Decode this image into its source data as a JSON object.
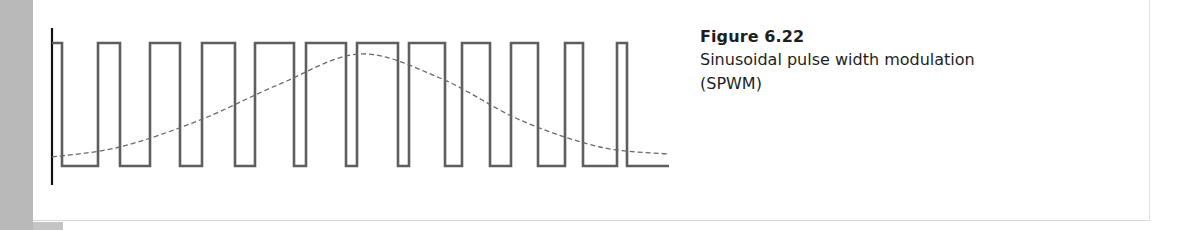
{
  "caption": {
    "label": "Figure 6.22",
    "text": "Sinusoidal pulse width modulation (SPWM)"
  },
  "colors": {
    "side_strip": "#b9b9b9",
    "pulse_stroke": "#5e5e5e",
    "axis_stroke": "#111111",
    "sine_stroke": "#6a6a6a"
  },
  "chart_data": {
    "type": "line",
    "title": "Sinusoidal pulse width modulation (SPWM)",
    "xlabel": "",
    "ylabel": "",
    "series": [
      {
        "name": "PWM pulse train",
        "style": "solid",
        "levels": {
          "high": 1,
          "low": 0
        },
        "pulses_high_x_px": [
          [
            52,
            62
          ],
          [
            98,
            120
          ],
          [
            150,
            180
          ],
          [
            202,
            235
          ],
          [
            255,
            294
          ],
          [
            306,
            346
          ],
          [
            357,
            398
          ],
          [
            409,
            445
          ],
          [
            462,
            490
          ],
          [
            511,
            538
          ],
          [
            565,
            583
          ],
          [
            617,
            627
          ]
        ],
        "x_end_px": 669
      },
      {
        "name": "Sinusoidal reference",
        "style": "dashed",
        "description": "Half-cycle sine from minimum to maximum and back to minimum",
        "points_px": [
          [
            52,
            157
          ],
          [
            120,
            147
          ],
          [
            200,
            120
          ],
          [
            280,
            84
          ],
          [
            360,
            54
          ],
          [
            440,
            78
          ],
          [
            520,
            120
          ],
          [
            600,
            147
          ],
          [
            668,
            154
          ]
        ]
      }
    ],
    "grid": false,
    "legend": null
  }
}
